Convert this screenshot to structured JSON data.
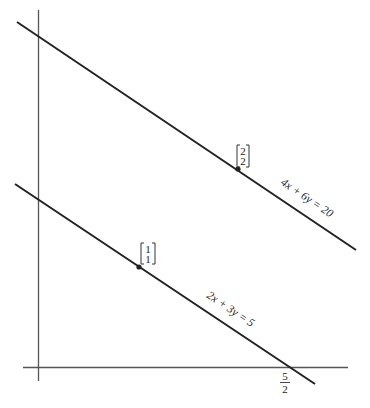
{
  "diagram": {
    "title": "",
    "lines": [
      {
        "id": "line-upper",
        "equation": "4x + 6y = 20",
        "x1": 17,
        "y1": 22,
        "x2": 356,
        "y2": 250
      },
      {
        "id": "line-lower",
        "equation": "2x + 3y = 5",
        "x1": 15,
        "y1": 184,
        "x2": 315,
        "y2": 384
      }
    ],
    "points": [
      {
        "id": "point-2-2",
        "top": "2",
        "bottom": "2",
        "cx": 238,
        "cy": 169
      },
      {
        "id": "point-1-1",
        "top": "1",
        "bottom": "1",
        "cx": 139,
        "cy": 267
      }
    ],
    "x_intercept_label": {
      "numerator": "5",
      "denominator": "2"
    },
    "colors": {
      "line": "#222222",
      "axis": "#555555",
      "background": "#ffffff"
    }
  }
}
